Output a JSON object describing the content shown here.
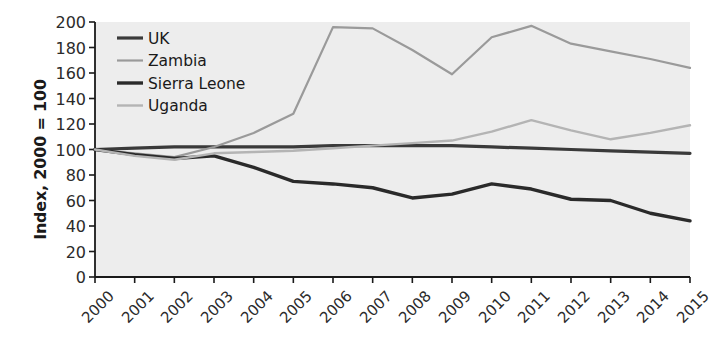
{
  "chart_data": {
    "type": "line",
    "title": "",
    "subtitle": "",
    "xlabel": "",
    "ylabel": "Index, 2000 = 100",
    "categories": [
      "2000",
      "2001",
      "2002",
      "2003",
      "2004",
      "2005",
      "2006",
      "2007",
      "2008",
      "2009",
      "2010",
      "2011",
      "2012",
      "2013",
      "2014",
      "2015"
    ],
    "x": [
      2000,
      2001,
      2002,
      2003,
      2004,
      2005,
      2006,
      2007,
      2008,
      2009,
      2010,
      2011,
      2012,
      2013,
      2014,
      2015
    ],
    "ylim": [
      0,
      200
    ],
    "xlim": [
      2000,
      2015
    ],
    "yticks": [
      0,
      20,
      40,
      60,
      80,
      100,
      120,
      140,
      160,
      180,
      200
    ],
    "grid": false,
    "legend_position": "top-left",
    "series": [
      {
        "name": "UK",
        "color": "#3a3a3a",
        "width": 3.2,
        "values": [
          100,
          101,
          102,
          102,
          102,
          102,
          103,
          103,
          103,
          103,
          102,
          101,
          100,
          99,
          98,
          97
        ]
      },
      {
        "name": "Zambia",
        "color": "#9a9a9a",
        "width": 2.2,
        "values": [
          100,
          97,
          94,
          102,
          113,
          128,
          196,
          195,
          178,
          159,
          188,
          197,
          183,
          177,
          171,
          164
        ]
      },
      {
        "name": "Sierra Leone",
        "color": "#2a2a2a",
        "width": 3.4,
        "values": [
          100,
          96,
          93,
          95,
          86,
          75,
          73,
          70,
          62,
          65,
          73,
          69,
          61,
          60,
          50,
          44
        ]
      },
      {
        "name": "Uganda",
        "color": "#b4b4b4",
        "width": 2.4,
        "values": [
          100,
          95,
          92,
          97,
          98,
          99,
          101,
          103,
          105,
          107,
          114,
          123,
          115,
          108,
          113,
          119
        ]
      }
    ]
  },
  "axis": {
    "y_title": "Index, 2000 = 100",
    "ytick_labels": [
      "200",
      "180",
      "160",
      "140",
      "120",
      "100",
      "80",
      "60",
      "40",
      "20",
      "0"
    ],
    "xtick_labels": [
      "2000",
      "2001",
      "2002",
      "2003",
      "2004",
      "2005",
      "2006",
      "2007",
      "2008",
      "2009",
      "2010",
      "2011",
      "2012",
      "2013",
      "2014",
      "2015"
    ]
  },
  "legend": {
    "items": [
      {
        "label": "UK"
      },
      {
        "label": "Zambia"
      },
      {
        "label": "Sierra Leone"
      },
      {
        "label": "Uganda"
      }
    ]
  },
  "style": {
    "plot_background": "#ededed",
    "axis_color": "#1a1a1a",
    "page_background": "#ffffff"
  }
}
